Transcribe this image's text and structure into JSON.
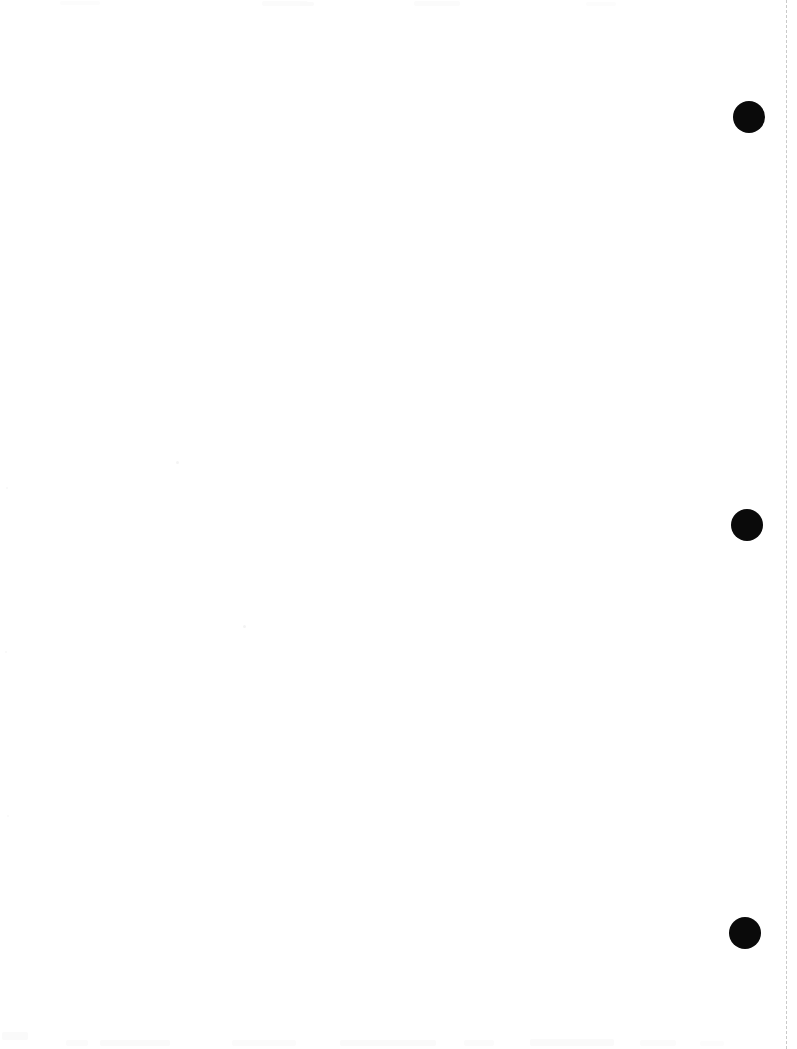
{
  "page": {
    "width": 797,
    "height": 1049,
    "background_color": "#ffffff",
    "body_text": ""
  },
  "margin_rule": {
    "name": "dashed-margin-rule",
    "x": 786,
    "top": 0,
    "height": 1049,
    "color": "#c9c9c9",
    "thickness": 1,
    "dash_length": 10,
    "gap_length": 7,
    "style": "dashed",
    "orientation": "vertical"
  },
  "punch_marks": [
    {
      "name": "punch-mark-top",
      "label": "1",
      "cx": 749,
      "cy": 117,
      "diameter": 32,
      "color": "#0a0a0a"
    },
    {
      "name": "punch-mark-middle",
      "label": "2",
      "cx": 747,
      "cy": 525,
      "diameter": 32,
      "color": "#0a0a0a"
    },
    {
      "name": "punch-mark-bottom",
      "label": "3",
      "cx": 745,
      "cy": 933,
      "diameter": 32,
      "color": "#0a0a0a"
    }
  ],
  "scan_specks": [
    {
      "name": "speck-upper-left",
      "x": 176,
      "y": 461,
      "size": 3,
      "color": "#f2f2f2"
    },
    {
      "name": "speck-center",
      "x": 243,
      "y": 625,
      "size": 3,
      "color": "#f1f1f1"
    },
    {
      "name": "speck-left-margin-a",
      "x": 6,
      "y": 487,
      "size": 2,
      "color": "#f6f6f6"
    },
    {
      "name": "speck-left-margin-b",
      "x": 5,
      "y": 651,
      "size": 2,
      "color": "#f6f6f6"
    },
    {
      "name": "speck-left-margin-c",
      "x": 7,
      "y": 815,
      "size": 2,
      "color": "#f7f7f7"
    }
  ],
  "edge_smudges": [
    {
      "name": "smudge-top-a",
      "x": 60,
      "y": 1,
      "width": 40,
      "height": 4,
      "color": "#fcfcfc"
    },
    {
      "name": "smudge-top-b",
      "x": 262,
      "y": 1,
      "width": 46,
      "height": 5,
      "color": "#fbfbfb"
    },
    {
      "name": "smudge-top-c",
      "x": 300,
      "y": 2,
      "width": 14,
      "height": 4,
      "color": "#fafafa"
    },
    {
      "name": "smudge-top-d",
      "x": 414,
      "y": 1,
      "width": 46,
      "height": 5,
      "color": "#fbfbfb"
    },
    {
      "name": "smudge-top-e",
      "x": 586,
      "y": 2,
      "width": 30,
      "height": 4,
      "color": "#fcfcfc"
    },
    {
      "name": "smudge-bottom-a",
      "x": 2,
      "y": 1032,
      "width": 26,
      "height": 8,
      "color": "#fafafa"
    },
    {
      "name": "smudge-bottom-b",
      "x": 66,
      "y": 1040,
      "width": 22,
      "height": 6,
      "color": "#fbfbfb"
    },
    {
      "name": "smudge-bottom-c",
      "x": 100,
      "y": 1040,
      "width": 70,
      "height": 6,
      "color": "#fafafa"
    },
    {
      "name": "smudge-bottom-d",
      "x": 232,
      "y": 1040,
      "width": 64,
      "height": 6,
      "color": "#fbfbfb"
    },
    {
      "name": "smudge-bottom-e",
      "x": 340,
      "y": 1040,
      "width": 96,
      "height": 6,
      "color": "#fafafa"
    },
    {
      "name": "smudge-bottom-f",
      "x": 464,
      "y": 1040,
      "width": 30,
      "height": 6,
      "color": "#fbfbfb"
    },
    {
      "name": "smudge-bottom-g",
      "x": 530,
      "y": 1039,
      "width": 84,
      "height": 7,
      "color": "#fafafa"
    },
    {
      "name": "smudge-bottom-h",
      "x": 640,
      "y": 1040,
      "width": 36,
      "height": 6,
      "color": "#fbfbfb"
    },
    {
      "name": "smudge-bottom-i",
      "x": 700,
      "y": 1041,
      "width": 24,
      "height": 5,
      "color": "#fcfcfc"
    }
  ]
}
